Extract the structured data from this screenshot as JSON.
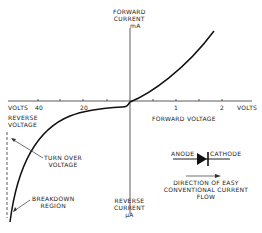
{
  "labels": {
    "forward_current": [
      "FORWARD",
      "CURRENT",
      "mA"
    ],
    "reverse_current": [
      "REVERSE",
      "CURRENT",
      "µA"
    ],
    "volts_left": "VOLTS",
    "volts_right": "VOLTS",
    "tick_40": "40",
    "tick_20": "20",
    "tick_1": "1",
    "tick_2": "2",
    "reverse_voltage": [
      "REVERSE",
      "VOLTAGE"
    ],
    "forward_voltage": "FORWARD  VOLTAGE",
    "turn_over_voltage": [
      "TURN  OVER",
      "VOLTAGE"
    ],
    "breakdown_region": [
      "BREAKDOWN",
      "REGION"
    ],
    "anode": "ANODE",
    "cathode": "CATHODE",
    "direction": [
      "DIRECTION  OF  EASY",
      "CONVENTIONAL  CURRENT",
      "FLOW"
    ]
  },
  "colors": {
    "ink": "#222222",
    "background": "#ffffff"
  }
}
